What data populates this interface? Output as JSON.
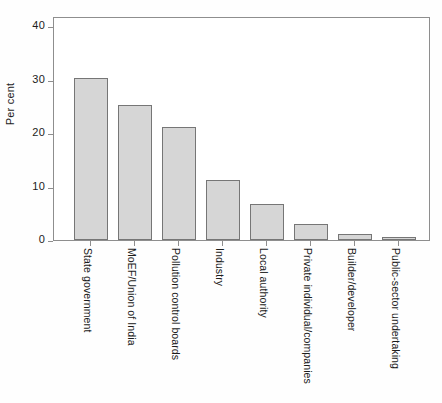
{
  "chart_data": {
    "type": "bar",
    "title": "",
    "subtitle": "",
    "xlabel": "",
    "ylabel": "Per cent",
    "ylim": [
      0,
      40
    ],
    "yticks": [
      0,
      10,
      20,
      30,
      40
    ],
    "ytick_labels": [
      "0",
      "10",
      "20",
      "30",
      "40"
    ],
    "grid": false,
    "legend": null,
    "categories": [
      "State government",
      "MoEF/Union of India",
      "Pollution control boards",
      "Industry",
      "Local authority",
      "Private individual/companies",
      "Builder/developer",
      "Public-sector undertaking"
    ],
    "values": [
      30.2,
      25.2,
      21.1,
      11.3,
      6.8,
      3.0,
      1.1,
      0.5
    ],
    "bar_fill_color": "#d6d6d6",
    "bar_edge_color": "#767676",
    "axis_color": "#8e8e8e",
    "background_color": "#ffffff"
  }
}
